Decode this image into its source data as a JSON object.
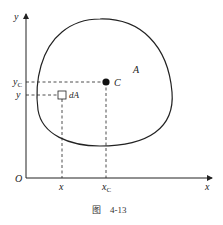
{
  "figure": {
    "caption": "图    4-13",
    "colors": {
      "ink": "#222222",
      "background": "#ffffff"
    }
  },
  "axes": {
    "x_label": "x",
    "y_label": "y",
    "origin_label": "O"
  },
  "labels": {
    "region": "A",
    "centroid": "C",
    "element": "dA",
    "y_centroid": "y",
    "y_centroid_sub": "C",
    "y_element": "y",
    "x_element": "x",
    "x_centroid": "x",
    "x_centroid_sub": "C"
  }
}
